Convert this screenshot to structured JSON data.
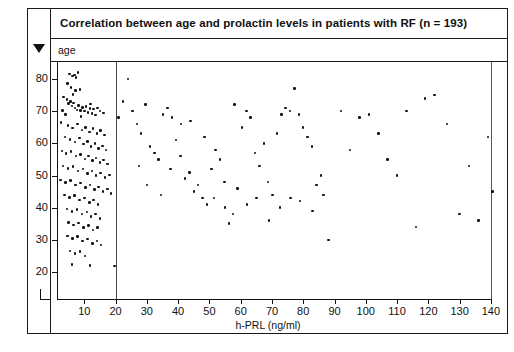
{
  "figure": {
    "title": "Correlation between age and prolactin levels in patients with RF (n = 193)",
    "y_band_label": "age",
    "marker_icon": "triangle-down-icon"
  },
  "colors": {
    "ink": "#111111",
    "frame": "#1a1a1a",
    "reference_line": "#444444",
    "background": "#ffffff"
  },
  "chart_data": {
    "type": "scatter",
    "title": "Correlation between age and prolactin levels in patients with RF (n = 193)",
    "xlabel": "h-PRL (ng/ml)",
    "ylabel": "age",
    "n": 193,
    "xlim": [
      0,
      142
    ],
    "ylim": [
      16,
      84
    ],
    "xticks": [
      10,
      20,
      30,
      40,
      50,
      60,
      70,
      80,
      90,
      100,
      110,
      120,
      130,
      140
    ],
    "yticks": [
      20,
      30,
      40,
      50,
      60,
      70,
      80
    ],
    "grid": false,
    "legend": null,
    "annotations": [
      {
        "type": "vline",
        "x": 20,
        "label": "reference line at h-PRL = 20 ng/ml"
      }
    ],
    "series": [
      {
        "name": "patients with RF",
        "marker": "dot",
        "color": "#111111",
        "points": [
          [
            5.2,
            81.5
          ],
          [
            6.2,
            81.0
          ],
          [
            6.8,
            81.3
          ],
          [
            8.0,
            82.0
          ],
          [
            7.4,
            80.4
          ],
          [
            4.6,
            78.6
          ],
          [
            5.8,
            77.4
          ],
          [
            7.2,
            76.4
          ],
          [
            6.4,
            75.2
          ],
          [
            8.6,
            76.8
          ],
          [
            3.4,
            74.4
          ],
          [
            4.4,
            73.6
          ],
          [
            5.0,
            72.4
          ],
          [
            5.6,
            73.0
          ],
          [
            6.0,
            71.6
          ],
          [
            6.6,
            72.6
          ],
          [
            7.0,
            71.0
          ],
          [
            7.6,
            70.4
          ],
          [
            8.2,
            71.8
          ],
          [
            8.8,
            70.2
          ],
          [
            9.4,
            71.2
          ],
          [
            10.0,
            70.0
          ],
          [
            10.6,
            71.4
          ],
          [
            11.2,
            69.6
          ],
          [
            11.8,
            70.8
          ],
          [
            12.4,
            69.2
          ],
          [
            13.0,
            70.6
          ],
          [
            13.6,
            68.8
          ],
          [
            14.2,
            71.0
          ],
          [
            4.0,
            69.0
          ],
          [
            3.0,
            70.2
          ],
          [
            9.0,
            68.4
          ],
          [
            12.0,
            72.2
          ],
          [
            15.0,
            70.0
          ],
          [
            16.2,
            69.4
          ],
          [
            2.6,
            66.4
          ],
          [
            4.8,
            65.6
          ],
          [
            6.2,
            64.8
          ],
          [
            7.8,
            66.0
          ],
          [
            9.2,
            64.2
          ],
          [
            10.4,
            65.0
          ],
          [
            11.6,
            63.6
          ],
          [
            12.8,
            64.6
          ],
          [
            14.0,
            63.0
          ],
          [
            15.2,
            64.0
          ],
          [
            16.4,
            62.6
          ],
          [
            3.8,
            62.0
          ],
          [
            5.4,
            61.2
          ],
          [
            7.0,
            60.4
          ],
          [
            8.4,
            61.6
          ],
          [
            9.8,
            59.8
          ],
          [
            11.0,
            60.6
          ],
          [
            12.2,
            59.0
          ],
          [
            13.4,
            60.0
          ],
          [
            14.6,
            58.4
          ],
          [
            15.8,
            59.2
          ],
          [
            17.0,
            58.0
          ],
          [
            2.8,
            57.6
          ],
          [
            4.2,
            56.8
          ],
          [
            5.8,
            57.4
          ],
          [
            7.4,
            56.0
          ],
          [
            8.8,
            56.6
          ],
          [
            10.2,
            55.2
          ],
          [
            11.4,
            56.0
          ],
          [
            12.6,
            54.6
          ],
          [
            13.8,
            55.4
          ],
          [
            15.0,
            54.0
          ],
          [
            16.2,
            54.8
          ],
          [
            17.4,
            53.6
          ],
          [
            3.2,
            53.0
          ],
          [
            4.8,
            52.2
          ],
          [
            6.4,
            52.8
          ],
          [
            8.0,
            51.4
          ],
          [
            9.6,
            52.0
          ],
          [
            11.0,
            50.6
          ],
          [
            12.4,
            51.4
          ],
          [
            13.8,
            50.0
          ],
          [
            15.2,
            50.8
          ],
          [
            16.6,
            49.4
          ],
          [
            18.0,
            50.2
          ],
          [
            2.4,
            48.6
          ],
          [
            4.0,
            47.8
          ],
          [
            5.6,
            48.4
          ],
          [
            7.2,
            47.0
          ],
          [
            8.8,
            47.6
          ],
          [
            10.4,
            46.2
          ],
          [
            11.8,
            47.0
          ],
          [
            13.2,
            45.6
          ],
          [
            14.6,
            46.4
          ],
          [
            16.0,
            45.0
          ],
          [
            17.4,
            45.8
          ],
          [
            18.6,
            44.4
          ],
          [
            3.6,
            44.0
          ],
          [
            5.2,
            43.2
          ],
          [
            6.8,
            43.8
          ],
          [
            8.4,
            42.4
          ],
          [
            10.0,
            43.0
          ],
          [
            11.6,
            41.6
          ],
          [
            13.0,
            42.4
          ],
          [
            14.4,
            41.0
          ],
          [
            4.4,
            39.6
          ],
          [
            6.0,
            38.8
          ],
          [
            7.6,
            39.4
          ],
          [
            9.2,
            38.0
          ],
          [
            10.8,
            38.6
          ],
          [
            12.2,
            37.2
          ],
          [
            13.6,
            38.0
          ],
          [
            15.0,
            36.6
          ],
          [
            5.0,
            35.4
          ],
          [
            6.6,
            34.6
          ],
          [
            8.2,
            35.2
          ],
          [
            9.8,
            33.8
          ],
          [
            11.4,
            34.4
          ],
          [
            12.8,
            33.0
          ],
          [
            14.2,
            33.8
          ],
          [
            4.6,
            31.2
          ],
          [
            6.2,
            30.4
          ],
          [
            7.8,
            31.0
          ],
          [
            9.4,
            29.6
          ],
          [
            11.0,
            30.2
          ],
          [
            12.6,
            28.8
          ],
          [
            14.0,
            29.6
          ],
          [
            15.4,
            28.4
          ],
          [
            5.4,
            26.6
          ],
          [
            7.0,
            25.8
          ],
          [
            8.6,
            26.4
          ],
          [
            10.2,
            25.0
          ],
          [
            6.0,
            22.4
          ],
          [
            11.8,
            22.0
          ],
          [
            19.6,
            21.8
          ],
          [
            21.0,
            68.0
          ],
          [
            22.4,
            73.0
          ],
          [
            24.0,
            80.0
          ],
          [
            25.4,
            70.0
          ],
          [
            26.8,
            66.0
          ],
          [
            28.2,
            63.0
          ],
          [
            29.6,
            72.0
          ],
          [
            31.0,
            59.0
          ],
          [
            32.4,
            57.0
          ],
          [
            33.8,
            55.0
          ],
          [
            35.2,
            69.0
          ],
          [
            36.6,
            71.0
          ],
          [
            38.0,
            68.0
          ],
          [
            39.4,
            61.0
          ],
          [
            40.8,
            56.0
          ],
          [
            42.2,
            49.0
          ],
          [
            43.6,
            51.0
          ],
          [
            45.0,
            45.0
          ],
          [
            46.4,
            47.0
          ],
          [
            47.8,
            43.0
          ],
          [
            49.2,
            41.0
          ],
          [
            50.6,
            52.0
          ],
          [
            52.0,
            58.0
          ],
          [
            53.4,
            55.0
          ],
          [
            54.8,
            48.0
          ],
          [
            56.2,
            35.0
          ],
          [
            57.6,
            38.0
          ],
          [
            59.0,
            46.0
          ],
          [
            60.4,
            65.0
          ],
          [
            61.8,
            70.0
          ],
          [
            63.2,
            68.0
          ],
          [
            64.6,
            57.0
          ],
          [
            66.0,
            53.0
          ],
          [
            67.4,
            60.0
          ],
          [
            68.8,
            48.0
          ],
          [
            70.2,
            44.0
          ],
          [
            71.6,
            63.0
          ],
          [
            73.0,
            69.0
          ],
          [
            74.4,
            71.0
          ],
          [
            75.8,
            70.0
          ],
          [
            77.2,
            77.0
          ],
          [
            78.6,
            69.0
          ],
          [
            80.0,
            65.0
          ],
          [
            81.4,
            62.0
          ],
          [
            82.8,
            59.0
          ],
          [
            84.2,
            47.0
          ],
          [
            85.6,
            50.0
          ],
          [
            88.0,
            30.0
          ],
          [
            92.0,
            70.0
          ],
          [
            95.0,
            58.0
          ],
          [
            98.0,
            68.0
          ],
          [
            101.0,
            69.0
          ],
          [
            104.0,
            63.0
          ],
          [
            107.0,
            55.0
          ],
          [
            110.0,
            50.0
          ],
          [
            113.0,
            70.0
          ],
          [
            116.0,
            34.0
          ],
          [
            119.0,
            74.0
          ],
          [
            122.0,
            75.0
          ],
          [
            126.0,
            66.0
          ],
          [
            130.0,
            38.0
          ],
          [
            133.0,
            53.0
          ],
          [
            136.0,
            36.0
          ],
          [
            139.0,
            62.0
          ],
          [
            140.5,
            45.0
          ],
          [
            27.5,
            53.0
          ],
          [
            30.0,
            47.0
          ],
          [
            34.5,
            44.0
          ],
          [
            37.5,
            52.0
          ],
          [
            41.0,
            66.0
          ],
          [
            44.0,
            67.0
          ],
          [
            48.5,
            62.0
          ],
          [
            51.5,
            43.0
          ],
          [
            55.0,
            40.0
          ],
          [
            58.0,
            72.0
          ],
          [
            62.0,
            41.0
          ],
          [
            65.0,
            43.0
          ],
          [
            69.0,
            36.0
          ],
          [
            72.5,
            40.0
          ],
          [
            76.0,
            43.0
          ],
          [
            79.0,
            42.0
          ],
          [
            83.0,
            39.0
          ],
          [
            86.5,
            44.0
          ]
        ]
      }
    ]
  }
}
